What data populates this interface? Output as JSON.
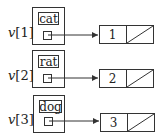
{
  "diagram": {
    "type": "array-of-records-with-linked-list-pointers",
    "entries": [
      {
        "index_label": "v[1]",
        "var": "v",
        "idx": "[1]",
        "name": "cat",
        "node_value": "1"
      },
      {
        "index_label": "v[2]",
        "var": "v",
        "idx": "[2]",
        "name": "rat",
        "node_value": "2"
      },
      {
        "index_label": "v[3]",
        "var": "v",
        "idx": "[3]",
        "name": "dog",
        "node_value": "3"
      }
    ],
    "colors": {
      "stroke": "#333333",
      "background": "#ffffff"
    }
  }
}
